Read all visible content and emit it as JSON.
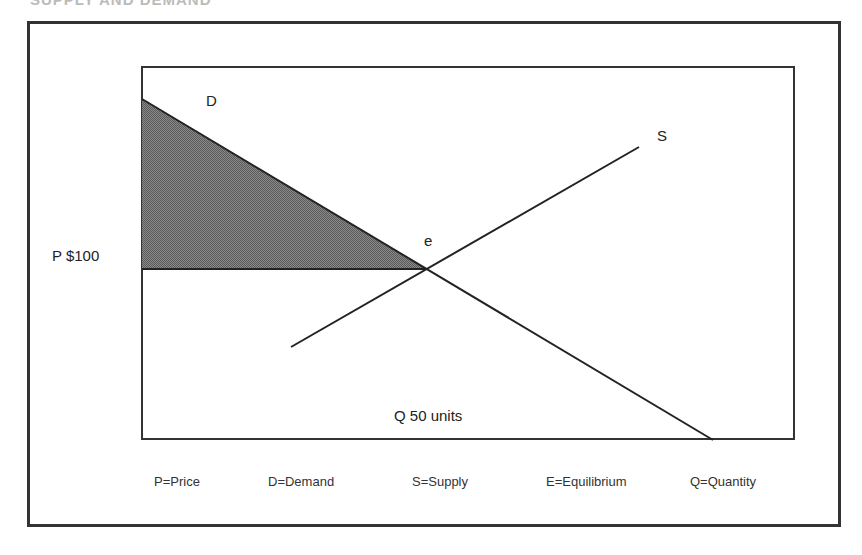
{
  "heading": "SUPPLY AND DEMAND",
  "diagram": {
    "labels": {
      "demand": "D",
      "supply": "S",
      "equilibrium": "e",
      "price": "P $100",
      "quantity": "Q 50 units"
    },
    "colors": {
      "frame": "#333333",
      "lines": "#222222",
      "shaded_area": "#777777"
    },
    "shaded_region": "consumer surplus (area above price P $100, below demand D)"
  },
  "legend": [
    {
      "label": "P=Price"
    },
    {
      "label": "D=Demand"
    },
    {
      "label": "S=Supply"
    },
    {
      "label": "E=Equilibrium"
    },
    {
      "label": "Q=Quantity"
    }
  ]
}
